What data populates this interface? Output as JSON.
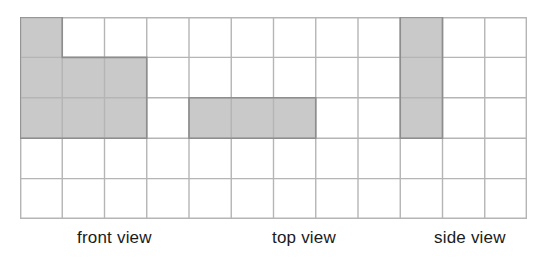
{
  "figure": {
    "background_color": "#ffffff",
    "grid": {
      "columns": 12,
      "rows": 5,
      "cell_width": 42.25,
      "cell_height": 40.4,
      "origin_x": 20,
      "origin_y": 17,
      "width": 507,
      "height": 202,
      "line_color": "#b5b5b5",
      "line_width": 1.4,
      "outer_line_color": "#b0b0b0"
    },
    "shading": {
      "fill_color": "#c9c9c9",
      "stroke_color": "#8d8d8d",
      "stroke_width": 1.6
    },
    "shapes": [
      {
        "name": "front-view-shape",
        "label": "front view",
        "cells": [
          {
            "col": 1,
            "row": 1
          },
          {
            "col": 1,
            "row": 2
          },
          {
            "col": 2,
            "row": 2
          },
          {
            "col": 3,
            "row": 2
          },
          {
            "col": 1,
            "row": 3
          },
          {
            "col": 2,
            "row": 3
          },
          {
            "col": 3,
            "row": 3
          }
        ],
        "cell_count": 7,
        "outline": [
          [
            1,
            1
          ],
          [
            2,
            1
          ],
          [
            2,
            2
          ],
          [
            4,
            2
          ],
          [
            4,
            4
          ],
          [
            1,
            4
          ]
        ]
      },
      {
        "name": "top-view-shape",
        "label": "top view",
        "cells": [
          {
            "col": 5,
            "row": 3
          },
          {
            "col": 6,
            "row": 3
          },
          {
            "col": 7,
            "row": 3
          }
        ],
        "cell_count": 3,
        "outline": [
          [
            5,
            3
          ],
          [
            8,
            3
          ],
          [
            8,
            4
          ],
          [
            5,
            4
          ]
        ]
      },
      {
        "name": "side-view-shape",
        "label": "side view",
        "cells": [
          {
            "col": 10,
            "row": 1
          },
          {
            "col": 10,
            "row": 2
          },
          {
            "col": 10,
            "row": 3
          }
        ],
        "cell_count": 3,
        "outline": [
          [
            10,
            1
          ],
          [
            11,
            1
          ],
          [
            11,
            4
          ],
          [
            10,
            4
          ]
        ]
      }
    ],
    "labels": {
      "front": "front view",
      "top": "top view",
      "side": "side view",
      "color": "#1b1b1b",
      "font_size": "17px"
    }
  }
}
